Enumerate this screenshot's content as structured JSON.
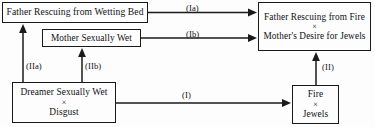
{
  "diagram": {
    "background_color": "#fdfdfe",
    "ink_color": "#1a1a1a",
    "nodes": {
      "father_bed": {
        "line1": "Father Rescuing from Wetting Bed"
      },
      "mother_wet": {
        "line1": "Mother Sexually Wet"
      },
      "dreamer": {
        "line1": "Dreamer Sexually Wet",
        "cross": "×",
        "line2": "Disgust"
      },
      "father_fire": {
        "line1": "Father Rescuing from Fire",
        "cross": "×",
        "line2": "Mother's Desire for Jewels"
      },
      "fire_jewels": {
        "line1": "Fire",
        "cross": "×",
        "line2": "Jewels"
      }
    },
    "arrows": {
      "Ia": "(Ia)",
      "Ib": "(Ib)",
      "I": "(I)",
      "IIa": "(IIa)",
      "IIb": "(IIb)",
      "II": "(II)"
    }
  }
}
